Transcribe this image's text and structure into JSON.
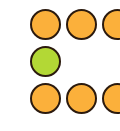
{
  "colors": {
    "orange": "#FBB03B",
    "green": "#B3D835",
    "border": "#2b1a0e",
    "background": "#ffffff"
  },
  "dots": [
    {
      "row": 0,
      "col": 0,
      "color": "orange",
      "x": 30,
      "y": 9
    },
    {
      "row": 0,
      "col": 1,
      "color": "orange",
      "x": 66,
      "y": 9
    },
    {
      "row": 0,
      "col": 2,
      "color": "orange",
      "x": 102,
      "y": 9
    },
    {
      "row": 1,
      "col": 0,
      "color": "green",
      "x": 30,
      "y": 46
    },
    {
      "row": 2,
      "col": 0,
      "color": "orange",
      "x": 30,
      "y": 83
    },
    {
      "row": 2,
      "col": 1,
      "color": "orange",
      "x": 66,
      "y": 83
    },
    {
      "row": 2,
      "col": 2,
      "color": "orange",
      "x": 102,
      "y": 83
    }
  ]
}
